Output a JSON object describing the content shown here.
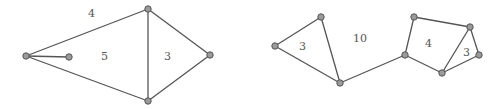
{
  "graphs": [
    {
      "id": "left",
      "vertices": [
        {
          "x": 26,
          "y": 56
        },
        {
          "x": 69,
          "y": 57
        },
        {
          "x": 148,
          "y": 9
        },
        {
          "x": 148,
          "y": 101
        },
        {
          "x": 210,
          "y": 55
        }
      ],
      "edges": [
        [
          0,
          1
        ],
        [
          0,
          2
        ],
        [
          0,
          3
        ],
        [
          2,
          3
        ],
        [
          2,
          4
        ],
        [
          3,
          4
        ]
      ],
      "face_labels": [
        {
          "text": "4",
          "x": 88,
          "y": 17
        },
        {
          "text": "5",
          "x": 101,
          "y": 60
        },
        {
          "text": "3",
          "x": 164,
          "y": 60
        }
      ]
    },
    {
      "id": "right",
      "vertices": [
        {
          "x": 275,
          "y": 46
        },
        {
          "x": 321,
          "y": 17
        },
        {
          "x": 340,
          "y": 83
        },
        {
          "x": 405,
          "y": 55
        },
        {
          "x": 414,
          "y": 17
        },
        {
          "x": 470,
          "y": 27
        },
        {
          "x": 442,
          "y": 73
        },
        {
          "x": 479,
          "y": 55
        }
      ],
      "edges": [
        [
          0,
          1
        ],
        [
          1,
          2
        ],
        [
          0,
          2
        ],
        [
          2,
          3
        ],
        [
          3,
          4
        ],
        [
          4,
          5
        ],
        [
          3,
          6
        ],
        [
          5,
          6
        ],
        [
          5,
          7
        ],
        [
          6,
          7
        ]
      ],
      "face_labels": [
        {
          "text": "3",
          "x": 299,
          "y": 50
        },
        {
          "text": "10",
          "x": 353,
          "y": 42
        },
        {
          "text": "4",
          "x": 425,
          "y": 47
        },
        {
          "text": "3",
          "x": 463,
          "y": 56
        }
      ]
    }
  ]
}
